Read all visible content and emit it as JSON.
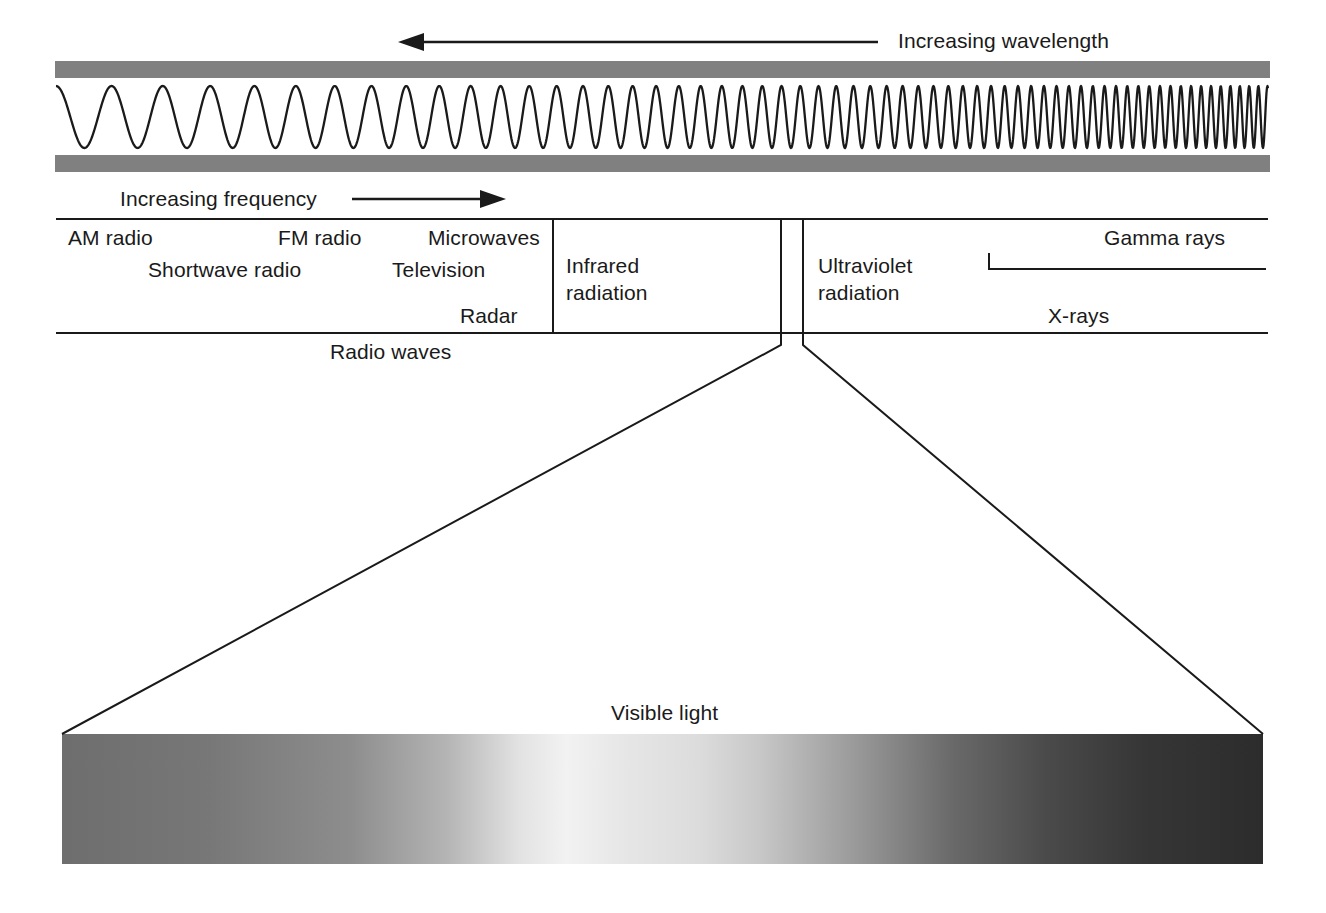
{
  "figure": {
    "kind": "electromagnetic-spectrum-diagram",
    "background_color": "#ffffff",
    "line_color": "#1a1a1a",
    "band_gray": "#808080"
  },
  "top_axis": {
    "wavelength_label": "Increasing wavelength",
    "wavelength_arrow_direction": "left",
    "frequency_label": "Increasing frequency",
    "frequency_arrow_direction": "right"
  },
  "wave_illustration": {
    "description": "sine wave with wavelength decreasing left to right between two gray bands",
    "cycles": 42,
    "left_wavelength_px": 58,
    "right_wavelength_px": 9
  },
  "bands": {
    "radio": {
      "summary_label": "Radio waves",
      "items": [
        {
          "label": "AM radio"
        },
        {
          "label": "FM radio"
        },
        {
          "label": "Microwaves"
        },
        {
          "label": "Shortwave radio"
        },
        {
          "label": "Television"
        },
        {
          "label": "Radar"
        }
      ]
    },
    "infrared": {
      "label_line1": "Infrared",
      "label_line2": "radiation"
    },
    "ultraviolet": {
      "label_line1": "Ultraviolet",
      "label_line2": "radiation"
    },
    "high_energy": {
      "gamma_label": "Gamma rays",
      "xray_label": "X-rays"
    }
  },
  "visible_light": {
    "label": "Visible light",
    "gradient_stops": [
      {
        "pos": 0,
        "color": "#6e6e6e"
      },
      {
        "pos": 12,
        "color": "#777777"
      },
      {
        "pos": 24,
        "color": "#8d8d8d"
      },
      {
        "pos": 32,
        "color": "#b4b4b4"
      },
      {
        "pos": 38,
        "color": "#e2e2e2"
      },
      {
        "pos": 42,
        "color": "#f2f2f2"
      },
      {
        "pos": 47,
        "color": "#e6e6e6"
      },
      {
        "pos": 53,
        "color": "#dcdcdc"
      },
      {
        "pos": 58,
        "color": "#c8c8c8"
      },
      {
        "pos": 66,
        "color": "#9a9a9a"
      },
      {
        "pos": 74,
        "color": "#6a6a6a"
      },
      {
        "pos": 82,
        "color": "#4a4a4a"
      },
      {
        "pos": 90,
        "color": "#363636"
      },
      {
        "pos": 100,
        "color": "#2c2c2c"
      }
    ]
  },
  "chart_data": {
    "type": "table",
    "xlabel": "Increasing frequency (left to right) / Increasing wavelength (right to left)",
    "categories": [
      "Radio waves",
      "Infrared radiation",
      "Visible light",
      "Ultraviolet radiation",
      "X-rays",
      "Gamma rays"
    ],
    "annotations": [
      "AM radio",
      "Shortwave radio",
      "FM radio",
      "Television",
      "Microwaves",
      "Radar"
    ]
  }
}
